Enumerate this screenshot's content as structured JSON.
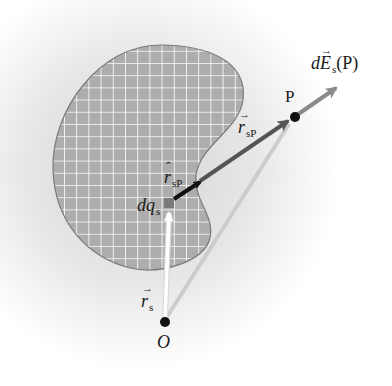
{
  "diagram": {
    "colors": {
      "background_glow": "#d9d9d9",
      "blob_fill": "#adadad",
      "blob_grid": "#ffffff",
      "blob_outline": "#7a7a7a",
      "charge_element": "#7a7a7a",
      "unit_vector": "#111111",
      "r_sP_vector": "#555555",
      "field_vector": "#8a8a8a",
      "r_P_line": "#cccccc",
      "r_s_vector": "#ffffff",
      "point": "#111111"
    },
    "points": {
      "origin": {
        "label": "O",
        "x": 165,
        "y": 322
      },
      "field_point": {
        "label": "P",
        "x": 295,
        "y": 117
      },
      "source": {
        "label": "dq",
        "subscript": "s",
        "x": 169,
        "y": 203
      }
    },
    "labels": {
      "field": {
        "prefix": "d",
        "symbol": "E",
        "subscript": "s",
        "suffix": "(P)"
      },
      "r_sP": {
        "symbol": "r",
        "subscript": "sP"
      },
      "r_hat_sP": {
        "symbol": "r",
        "subscript": "sP"
      },
      "dq_s": {
        "symbol": "dq",
        "subscript": "s"
      },
      "r_s": {
        "symbol": "r",
        "subscript": "s"
      },
      "P": "P",
      "O": "O"
    }
  }
}
